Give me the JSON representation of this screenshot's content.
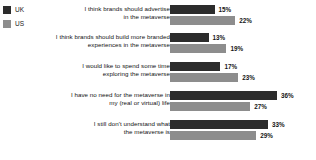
{
  "legend": {
    "position": "top-left",
    "items": [
      {
        "label": "UK",
        "color": "#2c2c2c",
        "swatch_name": "legend-swatch-uk"
      },
      {
        "label": "US",
        "color": "#8d8d8d",
        "swatch_name": "legend-swatch-us"
      }
    ]
  },
  "chart_data": {
    "type": "bar",
    "orientation": "horizontal",
    "grouped": true,
    "title": "",
    "subtitle": "",
    "xlabel": "",
    "ylabel": "",
    "xlim": [
      0,
      40
    ],
    "grid": false,
    "value_suffix": "%",
    "legend_position": "top-left",
    "categories": [
      "I think brands should advertise in the metaverse",
      "I think brands should build more branded experiences in the metaverse",
      "I would like to spend some time exploring the metaverse",
      "I have no need for the metaverse in my (real or virtual) life",
      "I still don't understand what the metaverse is"
    ],
    "category_lines": [
      [
        "I think brands should advertise",
        "in the metaverse"
      ],
      [
        "I think brands should build more branded",
        "experiences in the metaverse"
      ],
      [
        "I would like to spend some time",
        "exploring the metaverse"
      ],
      [
        "I have no need for the metaverse in",
        "my (real or virtual) life"
      ],
      [
        "I still don't understand what",
        "the metaverse is"
      ]
    ],
    "series": [
      {
        "name": "UK",
        "color": "#2c2c2c",
        "values": [
          15,
          13,
          17,
          36,
          33
        ],
        "labels": [
          "15%",
          "13%",
          "17%",
          "36%",
          "33%"
        ]
      },
      {
        "name": "US",
        "color": "#8d8d8d",
        "values": [
          22,
          19,
          23,
          27,
          29
        ],
        "labels": [
          "22%",
          "19%",
          "23%",
          "27%",
          "29%"
        ]
      }
    ]
  }
}
